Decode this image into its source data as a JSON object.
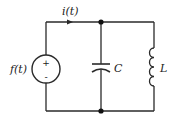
{
  "diagram": {
    "type": "circuit-schematic",
    "topology": "parallel LC with voltage source",
    "source": {
      "label": "f(t)",
      "kind": "voltage-source",
      "polarity_top": "+",
      "polarity_bottom": "-"
    },
    "current": {
      "label": "i(t)",
      "direction": "right"
    },
    "components": [
      {
        "id": "C",
        "label": "C",
        "kind": "capacitor"
      },
      {
        "id": "L",
        "label": "L",
        "kind": "inductor"
      }
    ],
    "nodes": [
      {
        "id": "top-junction"
      },
      {
        "id": "bottom-junction"
      }
    ],
    "colors": {
      "line": "#2a2a2a",
      "background": "#ffffff"
    }
  }
}
